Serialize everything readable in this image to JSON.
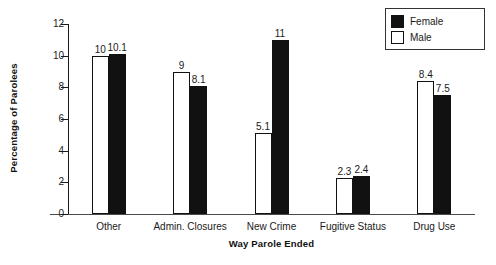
{
  "chart_data": {
    "type": "bar",
    "title": "",
    "xlabel": "Way Parole Ended",
    "ylabel": "Percentage of Parolees",
    "categories": [
      "Other",
      "Admin. Closures",
      "New Crime",
      "Fugitive Status",
      "Drug Use"
    ],
    "series": [
      {
        "name": "Male",
        "values": [
          10,
          9,
          5.1,
          2.3,
          8.4
        ],
        "fill": "#ffffff",
        "edge": "#111111"
      },
      {
        "name": "Female",
        "values": [
          10.1,
          8.1,
          11,
          2.4,
          7.5
        ],
        "fill": "#111111",
        "edge": "#111111"
      }
    ],
    "value_labels": {
      "Male": [
        "10",
        "9",
        "5.1",
        "2.3",
        "8.4"
      ],
      "Female": [
        "10.1",
        "8.1",
        "11",
        "2.4",
        "7.5"
      ]
    },
    "ylim": [
      0,
      12
    ],
    "yticks": [
      0,
      2,
      4,
      6,
      8,
      10,
      12
    ],
    "ytick_labels": [
      "0",
      "2",
      "4",
      "6",
      "8",
      "10",
      "12"
    ],
    "grid": false,
    "legend": {
      "position": "top-right",
      "entries": [
        {
          "label": "Female",
          "swatch": "filled"
        },
        {
          "label": "Male",
          "swatch": "empty"
        }
      ]
    },
    "series_order_in_group": [
      "Male",
      "Female"
    ]
  }
}
